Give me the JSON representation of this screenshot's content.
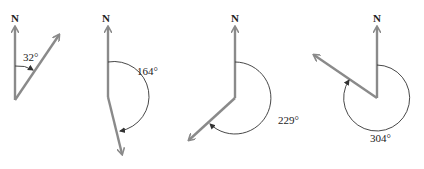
{
  "figure": {
    "type": "bearing-diagrams",
    "colors": {
      "vector": "#8a8a8a",
      "arc": "#333333",
      "text": "#222222"
    },
    "diagrams": [
      {
        "north_label": "N",
        "angle_label": "32°",
        "bearing": 32
      },
      {
        "north_label": "N",
        "angle_label": "164°",
        "bearing": 164
      },
      {
        "north_label": "N",
        "angle_label": "229°",
        "bearing": 229
      },
      {
        "north_label": "N",
        "angle_label": "304°",
        "bearing": 304
      }
    ]
  }
}
